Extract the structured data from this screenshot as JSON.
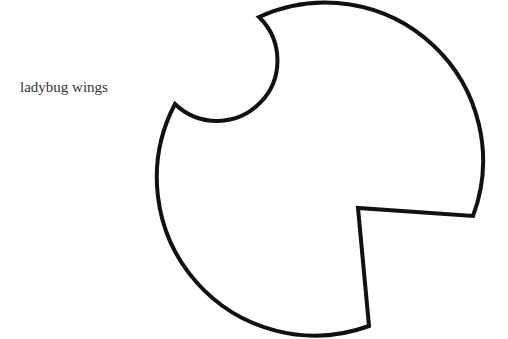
{
  "label": "ladybug wings",
  "shape": {
    "name": "ladybug-wing-outline",
    "stroke": "#111111",
    "fill": "#ffffff"
  }
}
